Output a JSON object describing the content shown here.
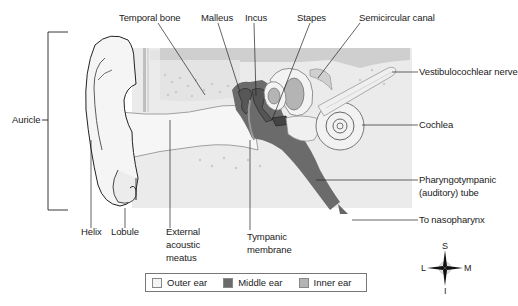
{
  "labels": {
    "temporal_bone": "Temporal bone",
    "malleus": "Malleus",
    "incus": "Incus",
    "stapes": "Stapes",
    "semicircular_canal": "Semicircular canal",
    "vestibulocochlear_nerve": "Vestibulocochlear nerve",
    "auricle": "Auricle",
    "cochlea": "Cochlea",
    "pharyngotympanic_line1": "Pharyngotympanic",
    "pharyngotympanic_line2": "(auditory) tube",
    "to_nasopharynx": "To nasopharynx",
    "helix": "Helix",
    "lobule": "Lobule",
    "external_line1": "External",
    "external_line2": "acoustic",
    "external_line3": "meatus",
    "tympanic_line1": "Tympanic",
    "tympanic_line2": "membrane"
  },
  "legend": {
    "items": [
      {
        "label": "Outer ear",
        "color": "#f4f4f4"
      },
      {
        "label": "Middle ear",
        "color": "#6b6b6b"
      },
      {
        "label": "Inner ear",
        "color": "#b4b4b4"
      }
    ]
  },
  "compass": {
    "top": "S",
    "bottom": "I",
    "left": "L",
    "right": "M"
  },
  "colors": {
    "outer_ear": "#f4f4f4",
    "middle_ear": "#6b6b6b",
    "inner_ear": "#b4b4b4",
    "bone": "#e9e9e9",
    "bone_top": "#d4d4d4",
    "outline": "#333333"
  }
}
